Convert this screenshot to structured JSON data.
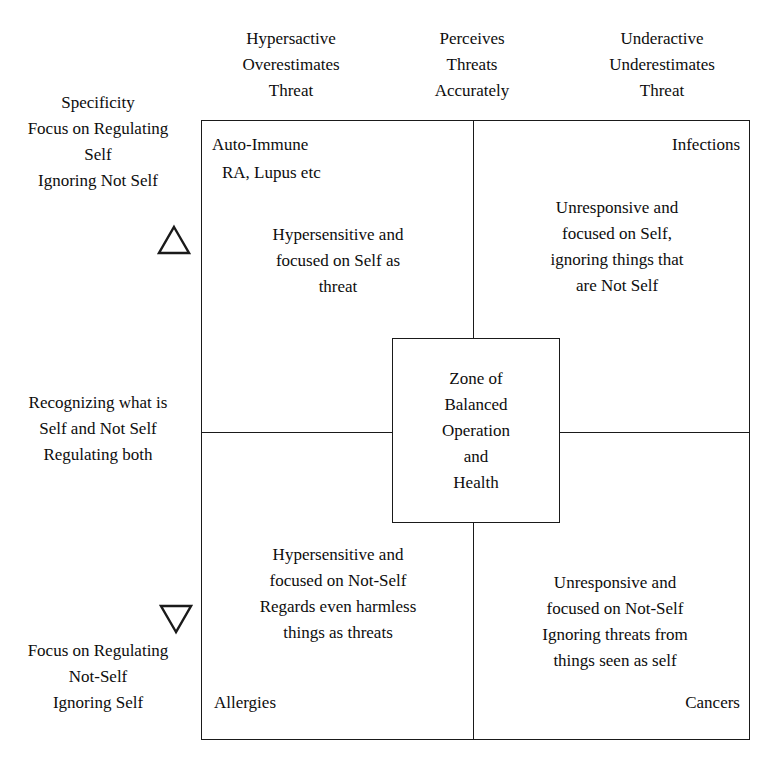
{
  "diagram": {
    "column_headers": [
      {
        "id": "hyperactive",
        "text": "Hypersactive\nOverestimates\nThreat"
      },
      {
        "id": "accurate",
        "text": "Perceives\nThreats\nAccurately"
      },
      {
        "id": "underactive",
        "text": "Underactive\nUnderestimates\nThreat"
      }
    ],
    "row_labels": [
      {
        "id": "specificity-self",
        "text": "Specificity\nFocus on Regulating\nSelf\nIgnoring Not Self"
      },
      {
        "id": "balanced-recognition",
        "text": "Recognizing what is\nSelf and Not Self\nRegulating both"
      },
      {
        "id": "focus-not-self",
        "text": "Focus on Regulating\nNot-Self\nIgnoring Self"
      }
    ],
    "axis_markers": [
      {
        "id": "up",
        "glyph": "triangle-up"
      },
      {
        "id": "down",
        "glyph": "triangle-down"
      }
    ],
    "quadrants": {
      "top_left": {
        "title": "Auto-Immune",
        "subtitle": "RA, Lupus etc",
        "body": "Hypersensitive and\nfocused on Self as\nthreat"
      },
      "top_right": {
        "title": "Infections",
        "body": "Unresponsive and\nfocused on Self,\nignoring things that\nare Not Self"
      },
      "bottom_left": {
        "body": "Hypersensitive and\nfocused on Not-Self\nRegards even harmless\nthings as threats",
        "footer": "Allergies"
      },
      "bottom_right": {
        "body": "Unresponsive and\nfocused on Not-Self\nIgnoring threats from\nthings seen as self",
        "footer": "Cancers"
      }
    },
    "center": {
      "text": "Zone of\nBalanced\nOperation\nand\nHealth"
    },
    "colors": {
      "line": "#1a1a1a",
      "text": "#0d0d0d",
      "background": "#ffffff"
    }
  }
}
